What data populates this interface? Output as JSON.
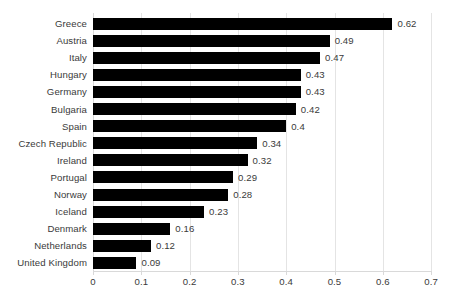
{
  "chart_data": {
    "type": "bar",
    "orientation": "horizontal",
    "title": "",
    "subtitle": "",
    "xlabel": "",
    "ylabel": "",
    "xlim": [
      0,
      0.7
    ],
    "xticks": [
      "0",
      "0.1",
      "0.2",
      "0.3",
      "0.4",
      "0.5",
      "0.6",
      "0.7"
    ],
    "xtick_values": [
      0,
      0.1,
      0.2,
      0.3,
      0.4,
      0.5,
      0.6,
      0.7
    ],
    "grid": "vertical",
    "legend": "none",
    "data_labels": true,
    "bar_color": "#000000",
    "gridline_color": "#E4E4E4",
    "text_color": "#3A3A3A",
    "background_color": "#FFFFFF",
    "categories": [
      "Greece",
      "Austria",
      "Italy",
      "Hungary",
      "Germany",
      "Bulgaria",
      "Spain",
      "Czech Republic",
      "Ireland",
      "Portugal",
      "Norway",
      "Iceland",
      "Denmark",
      "Netherlands",
      "United Kingdom"
    ],
    "values": [
      0.62,
      0.49,
      0.47,
      0.43,
      0.43,
      0.42,
      0.4,
      0.34,
      0.32,
      0.29,
      0.28,
      0.23,
      0.16,
      0.12,
      0.09
    ],
    "value_labels": [
      "0.62",
      "0.49",
      "0.47",
      "0.43",
      "0.43",
      "0.42",
      "0.4",
      "0.34",
      "0.32",
      "0.29",
      "0.28",
      "0.23",
      "0.16",
      "0.12",
      "0.09"
    ],
    "rows": [
      {
        "category": "Greece",
        "value": 0.62,
        "label": "0.62"
      },
      {
        "category": "Austria",
        "value": 0.49,
        "label": "0.49"
      },
      {
        "category": "Italy",
        "value": 0.47,
        "label": "0.47"
      },
      {
        "category": "Hungary",
        "value": 0.43,
        "label": "0.43"
      },
      {
        "category": "Germany",
        "value": 0.43,
        "label": "0.43"
      },
      {
        "category": "Bulgaria",
        "value": 0.42,
        "label": "0.42"
      },
      {
        "category": "Spain",
        "value": 0.4,
        "label": "0.4"
      },
      {
        "category": "Czech Republic",
        "value": 0.34,
        "label": "0.34"
      },
      {
        "category": "Ireland",
        "value": 0.32,
        "label": "0.32"
      },
      {
        "category": "Portugal",
        "value": 0.29,
        "label": "0.29"
      },
      {
        "category": "Norway",
        "value": 0.28,
        "label": "0.28"
      },
      {
        "category": "Iceland",
        "value": 0.23,
        "label": "0.23"
      },
      {
        "category": "Denmark",
        "value": 0.16,
        "label": "0.16"
      },
      {
        "category": "Netherlands",
        "value": 0.12,
        "label": "0.12"
      },
      {
        "category": "United Kingdom",
        "value": 0.09,
        "label": "0.09"
      }
    ]
  }
}
